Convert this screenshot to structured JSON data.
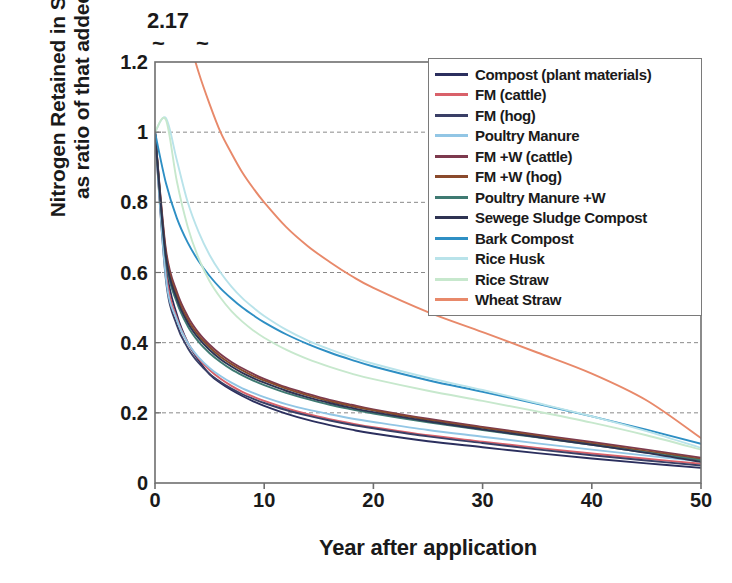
{
  "chart_data": {
    "type": "line",
    "title": "",
    "xlabel": "Year after application",
    "ylabel_lines": [
      "Nitrogen Retained in Soil",
      "as ratio of that added"
    ],
    "ylabel": "Nitrogen Retained in Soil as ratio of that added",
    "xlim": [
      0,
      50
    ],
    "ylim": [
      0,
      1.2
    ],
    "xticks": [
      0,
      10,
      20,
      30,
      40,
      50
    ],
    "xtick_labels": [
      "0",
      "10",
      "20",
      "30",
      "40",
      "50"
    ],
    "yticks": [
      0,
      0.2,
      0.4,
      0.6,
      0.8,
      1,
      1.2
    ],
    "ytick_labels": [
      "0",
      "0.2",
      "0.4",
      "0.6",
      "0.8",
      "1",
      "1.2"
    ],
    "grid": "horizontal-dashed",
    "legend_position": "top-right-inside",
    "axis_break": {
      "label": "2.17",
      "marker": "~",
      "note": "Wheat Straw starts off-scale at 2.17; axis broken above 1.2"
    },
    "x": [
      0,
      1,
      2,
      3,
      4,
      5,
      6,
      7,
      8,
      9,
      10,
      12,
      14,
      16,
      18,
      20,
      25,
      30,
      35,
      40,
      45,
      50
    ],
    "series": [
      {
        "name": "Compost (plant materials)",
        "color": "#2b2f5e",
        "start": 1.0,
        "end": 0.043,
        "values": [
          1.0,
          0.62,
          0.48,
          0.4,
          0.35,
          0.31,
          0.285,
          0.265,
          0.248,
          0.233,
          0.22,
          0.198,
          0.18,
          0.165,
          0.152,
          0.141,
          0.119,
          0.102,
          0.085,
          0.07,
          0.056,
          0.043
        ]
      },
      {
        "name": "FM (cattle)",
        "color": "#d9616a",
        "start": 1.0,
        "end": 0.055,
        "values": [
          1.0,
          0.6,
          0.47,
          0.4,
          0.355,
          0.322,
          0.297,
          0.277,
          0.26,
          0.246,
          0.234,
          0.213,
          0.196,
          0.182,
          0.17,
          0.159,
          0.136,
          0.118,
          0.1,
          0.084,
          0.069,
          0.055
        ]
      },
      {
        "name": "FM (hog)",
        "color": "#3a3f66",
        "start": 1.0,
        "end": 0.05,
        "values": [
          1.0,
          0.58,
          0.45,
          0.385,
          0.342,
          0.311,
          0.288,
          0.269,
          0.253,
          0.24,
          0.228,
          0.208,
          0.192,
          0.178,
          0.166,
          0.156,
          0.133,
          0.114,
          0.096,
          0.079,
          0.064,
          0.05
        ]
      },
      {
        "name": "Poultry Manure",
        "color": "#92c6e5",
        "start": 1.0,
        "end": 0.062,
        "values": [
          1.0,
          0.585,
          0.465,
          0.4,
          0.358,
          0.328,
          0.305,
          0.286,
          0.27,
          0.257,
          0.245,
          0.225,
          0.209,
          0.196,
          0.184,
          0.174,
          0.151,
          0.132,
          0.113,
          0.095,
          0.078,
          0.062
        ]
      },
      {
        "name": "FM +W (cattle)",
        "color": "#7d3a4e",
        "start": 1.0,
        "end": 0.072,
        "values": [
          1.0,
          0.665,
          0.545,
          0.475,
          0.428,
          0.394,
          0.367,
          0.345,
          0.327,
          0.311,
          0.297,
          0.273,
          0.254,
          0.237,
          0.223,
          0.21,
          0.183,
          0.16,
          0.138,
          0.117,
          0.095,
          0.072
        ]
      },
      {
        "name": "FM +W (hog)",
        "color": "#8a4a2c",
        "start": 1.0,
        "end": 0.068,
        "values": [
          1.0,
          0.655,
          0.535,
          0.466,
          0.42,
          0.387,
          0.36,
          0.339,
          0.321,
          0.305,
          0.292,
          0.269,
          0.25,
          0.233,
          0.219,
          0.207,
          0.18,
          0.157,
          0.135,
          0.113,
          0.091,
          0.068
        ]
      },
      {
        "name": "Poultry Manure +W",
        "color": "#3f7a72",
        "start": 1.0,
        "end": 0.065,
        "values": [
          1.0,
          0.635,
          0.515,
          0.447,
          0.402,
          0.37,
          0.345,
          0.324,
          0.307,
          0.292,
          0.279,
          0.257,
          0.239,
          0.223,
          0.21,
          0.198,
          0.173,
          0.151,
          0.13,
          0.109,
          0.087,
          0.065
        ]
      },
      {
        "name": "Sewege Sludge Compost",
        "color": "#2e3352",
        "start": 1.0,
        "end": 0.06,
        "values": [
          1.0,
          0.645,
          0.525,
          0.457,
          0.412,
          0.379,
          0.353,
          0.332,
          0.314,
          0.299,
          0.286,
          0.263,
          0.244,
          0.228,
          0.214,
          0.202,
          0.176,
          0.153,
          0.131,
          0.109,
          0.086,
          0.06
        ]
      },
      {
        "name": "Bark Compost",
        "color": "#2e8fc4",
        "start": 1.0,
        "end": 0.112,
        "values": [
          1.0,
          0.855,
          0.755,
          0.685,
          0.632,
          0.59,
          0.555,
          0.526,
          0.5,
          0.478,
          0.458,
          0.424,
          0.396,
          0.372,
          0.351,
          0.332,
          0.293,
          0.26,
          0.226,
          0.19,
          0.152,
          0.112
        ]
      },
      {
        "name": "Rice Husk",
        "color": "#b9e3ea",
        "start": 1.0,
        "end": 0.1,
        "values": [
          1.0,
          1.04,
          0.92,
          0.8,
          0.715,
          0.65,
          0.6,
          0.56,
          0.527,
          0.5,
          0.476,
          0.437,
          0.406,
          0.381,
          0.359,
          0.34,
          0.3,
          0.265,
          0.228,
          0.19,
          0.148,
          0.1
        ]
      },
      {
        "name": "Rice Straw",
        "color": "#c7e8cd",
        "start": 1.0,
        "end": 0.095,
        "values": [
          1.0,
          1.035,
          0.86,
          0.73,
          0.64,
          0.575,
          0.528,
          0.49,
          0.46,
          0.435,
          0.414,
          0.38,
          0.353,
          0.331,
          0.312,
          0.296,
          0.263,
          0.234,
          0.204,
          0.172,
          0.136,
          0.095
        ]
      },
      {
        "name": "Wheat Straw",
        "color": "#e8896a",
        "start": 2.17,
        "end": 0.128,
        "values": [
          2.17,
          1.62,
          1.42,
          1.28,
          1.17,
          1.08,
          1.0,
          0.94,
          0.885,
          0.84,
          0.8,
          0.73,
          0.675,
          0.63,
          0.59,
          0.556,
          0.487,
          0.43,
          0.372,
          0.312,
          0.236,
          0.128
        ]
      }
    ]
  },
  "legend": {
    "entries": [
      {
        "label": "Compost (plant materials)",
        "color": "#2b2f5e"
      },
      {
        "label": "FM (cattle)",
        "color": "#d9616a"
      },
      {
        "label": "FM (hog)",
        "color": "#3a3f66"
      },
      {
        "label": "Poultry Manure",
        "color": "#92c6e5"
      },
      {
        "label": "FM +W (cattle)",
        "color": "#7d3a4e"
      },
      {
        "label": "FM +W (hog)",
        "color": "#8a4a2c"
      },
      {
        "label": "Poultry Manure +W",
        "color": "#3f7a72"
      },
      {
        "label": "Sewege Sludge Compost",
        "color": "#2e3352"
      },
      {
        "label": "Bark Compost",
        "color": "#2e8fc4"
      },
      {
        "label": "Rice Husk",
        "color": "#b9e3ea"
      },
      {
        "label": "Rice Straw",
        "color": "#c7e8cd"
      },
      {
        "label": "Wheat Straw",
        "color": "#e8896a"
      }
    ]
  },
  "annotations": {
    "break_label": "2.17",
    "tilde_left": "~",
    "tilde_right": "~"
  },
  "style": {
    "axis_color": "#6e6e6e",
    "grid_color": "#8a8a8a",
    "text_color": "#1a1a1a",
    "plot_background": "#ffffff"
  }
}
